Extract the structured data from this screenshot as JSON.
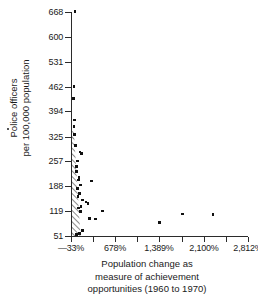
{
  "figure": {
    "kind": "scatter-plot",
    "stray_mark": "·"
  },
  "axes": {
    "y": {
      "title_line1": "Police officers",
      "title_line2": "per 100,000 population",
      "ticks": [
        "668",
        "600",
        "531",
        "462",
        "394",
        "325",
        "257",
        "188",
        "119",
        "51"
      ],
      "min": 51,
      "max": 668
    },
    "x": {
      "title_line1": "Population change as",
      "title_line2": "measure of achievement",
      "title_line3": "opportunities (1960 to 1970)",
      "ticks": [
        "—33%",
        "678%",
        "1,389%",
        "2,100%",
        "2,812%"
      ],
      "min": -33,
      "max": 2812
    }
  },
  "annotations": {
    "hatch_label": "dense-cluster-hatched-wedge"
  },
  "chart_data": {
    "type": "scatter",
    "title": "",
    "xlabel": "Population change as measure of achievement opportunities (1960 to 1970)",
    "ylabel": "Police officers per 100,000 population",
    "xlim": [
      -33,
      2812
    ],
    "ylim": [
      51,
      668
    ],
    "xticks": [
      -33,
      678,
      1389,
      2100,
      2812
    ],
    "xticklabels": [
      "—33%",
      "678%",
      "1,389%",
      "2,100%",
      "2,812%"
    ],
    "yticks": [
      51,
      119,
      188,
      257,
      325,
      394,
      462,
      531,
      600,
      668
    ],
    "yticklabels": [
      "51",
      "119",
      "188",
      "257",
      "325",
      "394",
      "462",
      "531",
      "600",
      "668"
    ],
    "grid": false,
    "legend": null,
    "points": [
      {
        "x": 30,
        "y": 670
      },
      {
        "x": 18,
        "y": 462
      },
      {
        "x": 10,
        "y": 430
      },
      {
        "x": 22,
        "y": 370
      },
      {
        "x": 15,
        "y": 352
      },
      {
        "x": 28,
        "y": 330
      },
      {
        "x": 40,
        "y": 300
      },
      {
        "x": 110,
        "y": 282
      },
      {
        "x": 135,
        "y": 278
      },
      {
        "x": 75,
        "y": 258
      },
      {
        "x": 60,
        "y": 242
      },
      {
        "x": 52,
        "y": 228
      },
      {
        "x": 95,
        "y": 212
      },
      {
        "x": 88,
        "y": 205
      },
      {
        "x": 300,
        "y": 203
      },
      {
        "x": 120,
        "y": 192
      },
      {
        "x": 68,
        "y": 182
      },
      {
        "x": 105,
        "y": 168
      },
      {
        "x": 80,
        "y": 160
      },
      {
        "x": 155,
        "y": 150
      },
      {
        "x": 205,
        "y": 145
      },
      {
        "x": 240,
        "y": 140
      },
      {
        "x": 130,
        "y": 133
      },
      {
        "x": 92,
        "y": 128
      },
      {
        "x": 470,
        "y": 120
      },
      {
        "x": 118,
        "y": 118
      },
      {
        "x": 1760,
        "y": 112
      },
      {
        "x": 2250,
        "y": 110
      },
      {
        "x": 265,
        "y": 100
      },
      {
        "x": 360,
        "y": 98
      },
      {
        "x": 1390,
        "y": 88
      },
      {
        "x": 150,
        "y": 66
      },
      {
        "x": 100,
        "y": 58
      },
      {
        "x": 58,
        "y": 55
      }
    ],
    "hatched_region": {
      "description": "hatched wedge marking dense overlapping points near x = —33%",
      "x_range": [
        -33,
        120
      ],
      "y_range": [
        51,
        340
      ]
    }
  }
}
